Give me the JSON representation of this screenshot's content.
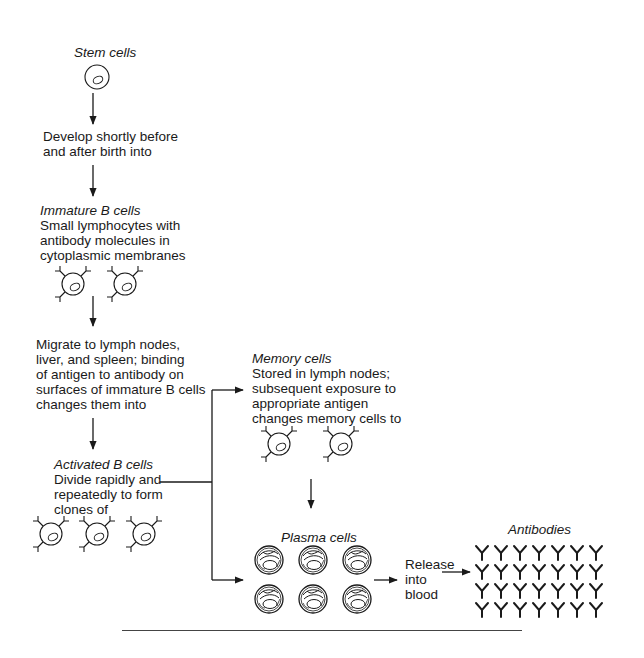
{
  "diagram": {
    "type": "flowchart",
    "topic": "B cell development and antibody production",
    "nodes": {
      "stem": {
        "title": "Stem cells",
        "cell_count": 1
      },
      "step1": {
        "text_lines": [
          "Develop shortly before",
          "and after birth into"
        ]
      },
      "immature": {
        "title": "Immature B cells",
        "text_lines": [
          "Small lymphocytes with",
          "antibody molecules in",
          "cytoplasmic membranes"
        ],
        "cell_count": 2
      },
      "step2": {
        "text_lines": [
          "Migrate to lymph nodes,",
          "liver, and spleen; binding",
          "of antigen to antibody on",
          "surfaces of immature B cells",
          "changes them into"
        ]
      },
      "activated": {
        "title": "Activated B cells",
        "text_lines": [
          "Divide rapidly and",
          "repeatedly to form",
          "clones of"
        ],
        "cell_count": 3
      },
      "memory": {
        "title": "Memory cells",
        "text_lines": [
          "Stored in lymph nodes;",
          "subsequent exposure to",
          "appropriate antigen",
          "changes memory cells to"
        ],
        "cell_count": 2
      },
      "plasma": {
        "title": "Plasma cells",
        "grid": {
          "rows": 2,
          "cols": 3
        }
      },
      "release": {
        "text_lines": [
          "Release",
          "into",
          "blood"
        ]
      },
      "antibodies": {
        "title": "Antibodies",
        "glyph": "Y",
        "grid": {
          "rows": 4,
          "cols": 7
        }
      }
    },
    "edges": [
      {
        "from": "stem",
        "to": "step1"
      },
      {
        "from": "step1",
        "to": "immature"
      },
      {
        "from": "immature",
        "to": "step2"
      },
      {
        "from": "step2",
        "to": "activated"
      },
      {
        "from": "activated",
        "to": "memory"
      },
      {
        "from": "activated",
        "to": "plasma"
      },
      {
        "from": "memory",
        "to": "plasma"
      },
      {
        "from": "plasma",
        "to": "antibodies",
        "label": "Release into blood"
      }
    ]
  },
  "colors": {
    "ink": "#1a1a1a",
    "background": "#ffffff"
  }
}
